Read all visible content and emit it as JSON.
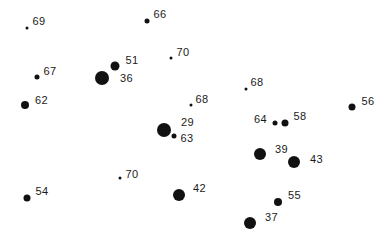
{
  "diagram": {
    "type": "proportional-dot-map",
    "background": "#ffffff",
    "dot_color": "#111111",
    "label_color": "#1a1a1a",
    "points": [
      {
        "label": "69",
        "x": 27,
        "y": 28,
        "d": 3,
        "lx": 4,
        "ly": -12
      },
      {
        "label": "66",
        "x": 147,
        "y": 21,
        "d": 5,
        "lx": 4,
        "ly": -12
      },
      {
        "label": "70",
        "x": 171,
        "y": 58,
        "d": 3,
        "lx": 4,
        "ly": -11
      },
      {
        "label": "51",
        "x": 115,
        "y": 66,
        "d": 9,
        "lx": 6,
        "ly": -11
      },
      {
        "label": "67",
        "x": 37,
        "y": 77,
        "d": 5,
        "lx": 4,
        "ly": -11
      },
      {
        "label": "36",
        "x": 102,
        "y": 78,
        "d": 14,
        "lx": 11,
        "ly": -5
      },
      {
        "label": "62",
        "x": 25,
        "y": 105,
        "d": 8,
        "lx": 6,
        "ly": -10
      },
      {
        "label": "68",
        "x": 246,
        "y": 89,
        "d": 3,
        "lx": 3,
        "ly": -12
      },
      {
        "label": "68",
        "x": 191,
        "y": 105,
        "d": 3,
        "lx": 3,
        "ly": -11
      },
      {
        "label": "56",
        "x": 352,
        "y": 107,
        "d": 7,
        "lx": 6,
        "ly": -11
      },
      {
        "label": "64",
        "x": 275,
        "y": 123,
        "d": 5,
        "lx": -21,
        "ly": -9
      },
      {
        "label": "58",
        "x": 285,
        "y": 123,
        "d": 7,
        "lx": 5,
        "ly": -12
      },
      {
        "label": "29",
        "x": 164,
        "y": 130,
        "d": 14,
        "lx": 10,
        "ly": -13
      },
      {
        "label": "63",
        "x": 174,
        "y": 136,
        "d": 5,
        "lx": 4,
        "ly": -3
      },
      {
        "label": "39",
        "x": 260,
        "y": 154,
        "d": 12,
        "lx": 9,
        "ly": -10
      },
      {
        "label": "43",
        "x": 294,
        "y": 162,
        "d": 12,
        "lx": 10,
        "ly": -8
      },
      {
        "label": "70",
        "x": 120,
        "y": 178,
        "d": 3,
        "lx": 4,
        "ly": -9
      },
      {
        "label": "54",
        "x": 27,
        "y": 198,
        "d": 7,
        "lx": 5,
        "ly": -12
      },
      {
        "label": "42",
        "x": 179,
        "y": 195,
        "d": 12,
        "lx": 8,
        "ly": -12
      },
      {
        "label": "55",
        "x": 278,
        "y": 202,
        "d": 8,
        "lx": 6,
        "ly": -12
      },
      {
        "label": "37",
        "x": 250,
        "y": 223,
        "d": 12,
        "lx": 9,
        "ly": -11
      }
    ]
  }
}
